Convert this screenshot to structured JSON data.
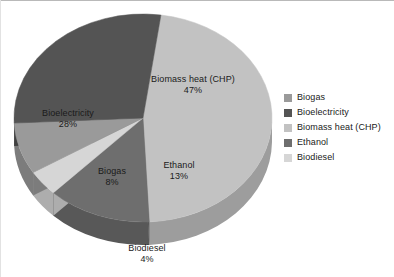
{
  "chart_data": {
    "type": "pie",
    "title": "",
    "subtitle": "",
    "xlabel": "",
    "ylabel": "",
    "grid": false,
    "legend_position": "right",
    "three_d": true,
    "start_angle_deg": -82,
    "direction": "clockwise",
    "categories": [
      "Biogas",
      "Bioelectricity",
      "Biomass heat (CHP)",
      "Ethanol",
      "Biodiesel"
    ],
    "values": [
      8,
      28,
      47,
      13,
      4
    ],
    "unit": "%",
    "slices": [
      {
        "label": "Biogas",
        "value": 8,
        "value_text": "8%",
        "color": "#9a9a9a",
        "side_color": "#7c7c7c"
      },
      {
        "label": "Bioelectricity",
        "value": 28,
        "value_text": "28%",
        "color": "#545454",
        "side_color": "#414141"
      },
      {
        "label": "Biomass heat (CHP)",
        "value": 47,
        "value_text": "47%",
        "color": "#c2c2c2",
        "side_color": "#9d9d9d"
      },
      {
        "label": "Ethanol",
        "value": 13,
        "value_text": "13%",
        "color": "#6e6e6e",
        "side_color": "#585858"
      },
      {
        "label": "Biodiesel",
        "value": 4,
        "value_text": "4%",
        "color": "#d6d6d6",
        "side_color": "#adadad"
      }
    ],
    "data_labels": [
      {
        "name": "biomass-heat-chp",
        "label": "Biomass heat (CHP)",
        "value_text": "47%"
      },
      {
        "name": "bioelectricity",
        "label": "Bioelectricity",
        "value_text": "28%"
      },
      {
        "name": "biogas",
        "label": "Biogas",
        "value_text": "8%"
      },
      {
        "name": "ethanol",
        "label": "Ethanol",
        "value_text": "13%"
      },
      {
        "name": "biodiesel",
        "label": "Biodiesel",
        "value_text": "4%"
      }
    ]
  },
  "legend": {
    "items": [
      {
        "label": "Biogas",
        "color": "#9a9a9a"
      },
      {
        "label": "Bioelectricity",
        "color": "#545454"
      },
      {
        "label": "Biomass heat (CHP)",
        "color": "#c2c2c2"
      },
      {
        "label": "Ethanol",
        "color": "#6e6e6e"
      },
      {
        "label": "Biodiesel",
        "color": "#d6d6d6"
      }
    ]
  }
}
